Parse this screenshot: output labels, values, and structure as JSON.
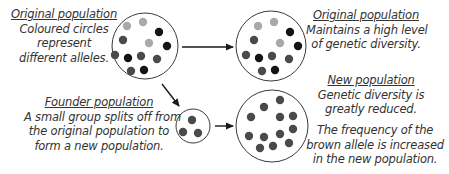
{
  "colors": {
    "light_allele": "#a9a9a9",
    "dark_allele": "#4a4a4a",
    "black_allele": "#141414",
    "outline": "#3a3a3a",
    "text": "#333333"
  },
  "labels": {
    "original_left": {
      "heading": "Original population",
      "lines": [
        "Coloured circles",
        "represent",
        "different alleles."
      ]
    },
    "original_right": {
      "heading": "Original population",
      "lines": [
        "Maintains a high level",
        "of genetic diversity."
      ]
    },
    "founder": {
      "heading": "Founder population",
      "lines": [
        "A small group splits off from",
        "the original population to",
        "form a new population."
      ]
    },
    "new_population": {
      "heading": "New population",
      "lines": [
        "Genetic diversity is",
        "greatly reduced."
      ],
      "note_lines": [
        "The frequency of the",
        "brown allele is increased",
        "in the new population."
      ]
    }
  },
  "populations": {
    "original_start": {
      "cx": 145,
      "cy": 46,
      "r": 33,
      "alleles": [
        {
          "x": 127,
          "y": 26,
          "type": "light"
        },
        {
          "x": 143,
          "y": 22,
          "type": "light"
        },
        {
          "x": 159,
          "y": 32,
          "type": "black"
        },
        {
          "x": 123,
          "y": 40,
          "type": "dark"
        },
        {
          "x": 149,
          "y": 43,
          "type": "light"
        },
        {
          "x": 167,
          "y": 46,
          "type": "black"
        },
        {
          "x": 115,
          "y": 55,
          "type": "dark"
        },
        {
          "x": 128,
          "y": 58,
          "type": "black"
        },
        {
          "x": 141,
          "y": 56,
          "type": "dark"
        },
        {
          "x": 157,
          "y": 59,
          "type": "dark"
        },
        {
          "x": 131,
          "y": 71,
          "type": "dark"
        },
        {
          "x": 144,
          "y": 70,
          "type": "black"
        }
      ]
    },
    "original_end": {
      "cx": 271,
      "cy": 46,
      "r": 35,
      "alleles": [
        {
          "x": 258,
          "y": 26,
          "type": "light"
        },
        {
          "x": 274,
          "y": 22,
          "type": "light"
        },
        {
          "x": 290,
          "y": 32,
          "type": "black"
        },
        {
          "x": 254,
          "y": 40,
          "type": "dark"
        },
        {
          "x": 280,
          "y": 43,
          "type": "light"
        },
        {
          "x": 298,
          "y": 46,
          "type": "black"
        },
        {
          "x": 246,
          "y": 55,
          "type": "dark"
        },
        {
          "x": 259,
          "y": 58,
          "type": "black"
        },
        {
          "x": 272,
          "y": 56,
          "type": "dark"
        },
        {
          "x": 289,
          "y": 59,
          "type": "dark"
        },
        {
          "x": 262,
          "y": 71,
          "type": "dark"
        },
        {
          "x": 275,
          "y": 70,
          "type": "black"
        }
      ]
    },
    "founder": {
      "cx": 193,
      "cy": 126,
      "r": 17,
      "alleles": [
        {
          "x": 192,
          "y": 120,
          "type": "dark"
        },
        {
          "x": 183,
          "y": 132,
          "type": "dark"
        },
        {
          "x": 198,
          "y": 133,
          "type": "dark"
        }
      ]
    },
    "new": {
      "cx": 272,
      "cy": 126,
      "r": 36,
      "alleles": [
        {
          "x": 280,
          "y": 100,
          "type": "dark"
        },
        {
          "x": 264,
          "y": 107,
          "type": "dark"
        },
        {
          "x": 251,
          "y": 117,
          "type": "dark"
        },
        {
          "x": 280,
          "y": 117,
          "type": "dark"
        },
        {
          "x": 293,
          "y": 116,
          "type": "dark"
        },
        {
          "x": 249,
          "y": 136,
          "type": "dark"
        },
        {
          "x": 264,
          "y": 137,
          "type": "dark"
        },
        {
          "x": 280,
          "y": 134,
          "type": "dark"
        },
        {
          "x": 293,
          "y": 129,
          "type": "dark"
        },
        {
          "x": 260,
          "y": 148,
          "type": "dark"
        },
        {
          "x": 273,
          "y": 146,
          "type": "dark"
        },
        {
          "x": 289,
          "y": 143,
          "type": "dark"
        }
      ]
    }
  },
  "arrows": [
    {
      "name": "original-to-original-arrow",
      "x1": 182,
      "y1": 47,
      "x2": 233,
      "y2": 47
    },
    {
      "name": "original-to-founder-arrow",
      "x1": 162,
      "y1": 84,
      "x2": 179,
      "y2": 106
    },
    {
      "name": "founder-to-new-arrow",
      "x1": 215,
      "y1": 126,
      "x2": 233,
      "y2": 126
    }
  ]
}
